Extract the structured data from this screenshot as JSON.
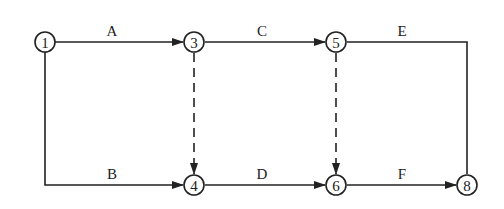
{
  "diagram": {
    "type": "activity-on-arrow network",
    "nodes": [
      {
        "id": "1",
        "label": "1",
        "x": 45,
        "y": 42
      },
      {
        "id": "3",
        "label": "3",
        "x": 194,
        "y": 42
      },
      {
        "id": "5",
        "label": "5",
        "x": 336,
        "y": 42
      },
      {
        "id": "4",
        "label": "4",
        "x": 194,
        "y": 185
      },
      {
        "id": "6",
        "label": "6",
        "x": 336,
        "y": 185
      },
      {
        "id": "8",
        "label": "8",
        "x": 467,
        "y": 185
      }
    ],
    "edges": [
      {
        "from": "1",
        "to": "3",
        "label": "A",
        "style": "solid"
      },
      {
        "from": "3",
        "to": "5",
        "label": "C",
        "style": "solid"
      },
      {
        "from": "5",
        "to": "8",
        "label": "E",
        "style": "solid"
      },
      {
        "from": "1",
        "to": "4",
        "label": "B",
        "style": "solid"
      },
      {
        "from": "4",
        "to": "6",
        "label": "D",
        "style": "solid"
      },
      {
        "from": "6",
        "to": "8",
        "label": "F",
        "style": "solid"
      },
      {
        "from": "3",
        "to": "4",
        "label": "",
        "style": "dashed"
      },
      {
        "from": "5",
        "to": "6",
        "label": "",
        "style": "dashed"
      }
    ],
    "colors": {
      "line": "#222222",
      "background": "#ffffff"
    }
  }
}
